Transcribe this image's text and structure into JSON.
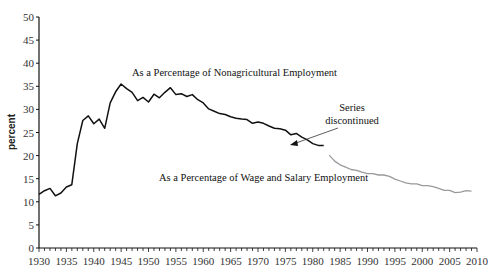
{
  "chart_data": {
    "type": "line",
    "title": "",
    "xlabel": "",
    "ylabel": "percent",
    "xlim": [
      1930,
      2010
    ],
    "ylim": [
      0,
      50
    ],
    "grid": false,
    "x_ticks": [
      1930,
      1935,
      1940,
      1945,
      1950,
      1955,
      1960,
      1965,
      1970,
      1975,
      1980,
      1985,
      1990,
      1995,
      2000,
      2005,
      2010
    ],
    "y_ticks": [
      0,
      5,
      10,
      15,
      20,
      25,
      30,
      35,
      40,
      45,
      50
    ],
    "series": [
      {
        "name": "As a Percentage of Nonagricultural Employment",
        "color": "#111111",
        "x": [
          1930,
          1931,
          1932,
          1933,
          1934,
          1935,
          1936,
          1937,
          1938,
          1939,
          1940,
          1941,
          1942,
          1943,
          1944,
          1945,
          1946,
          1947,
          1948,
          1949,
          1950,
          1951,
          1952,
          1953,
          1954,
          1955,
          1956,
          1957,
          1958,
          1959,
          1960,
          1961,
          1962,
          1963,
          1964,
          1965,
          1966,
          1967,
          1968,
          1969,
          1970,
          1971,
          1972,
          1973,
          1974,
          1975,
          1976,
          1977,
          1978,
          1979,
          1980,
          1981,
          1982
        ],
        "values": [
          11.6,
          12.4,
          12.9,
          11.3,
          11.9,
          13.2,
          13.7,
          22.6,
          27.6,
          28.6,
          26.9,
          27.9,
          25.9,
          31.4,
          33.8,
          35.5,
          34.5,
          33.7,
          31.9,
          32.6,
          31.6,
          33.3,
          32.5,
          33.7,
          34.7,
          33.2,
          33.4,
          32.8,
          33.2,
          32.1,
          31.4,
          30.1,
          29.6,
          29.1,
          28.9,
          28.4,
          28.1,
          27.9,
          27.8,
          27.0,
          27.3,
          27.0,
          26.4,
          25.9,
          25.8,
          25.5,
          24.5,
          24.8,
          24.0,
          23.4,
          22.6,
          22.2,
          22.2
        ]
      },
      {
        "name": "As a Percentage of Wage and Salary Employment",
        "color": "#9a9a9a",
        "x": [
          1983,
          1984,
          1985,
          1986,
          1987,
          1988,
          1989,
          1990,
          1991,
          1992,
          1993,
          1994,
          1995,
          1996,
          1997,
          1998,
          1999,
          2000,
          2001,
          2002,
          2003,
          2004,
          2005,
          2006,
          2007,
          2008,
          2009
        ],
        "values": [
          20.1,
          18.8,
          18.0,
          17.5,
          17.0,
          16.8,
          16.4,
          16.1,
          16.1,
          15.8,
          15.8,
          15.5,
          14.9,
          14.5,
          14.1,
          13.9,
          13.9,
          13.5,
          13.5,
          13.3,
          12.9,
          12.5,
          12.5,
          12.0,
          12.1,
          12.4,
          12.3
        ]
      }
    ],
    "annotations": [
      {
        "text": "As a Percentage of Nonagricultural Employment",
        "x": 1948,
        "y": 38.5
      },
      {
        "text": "As a Percentage of Wage and Salary Employment",
        "x": 1951,
        "y": 15.5
      },
      {
        "text_lines": [
          "Series",
          "discontinued"
        ],
        "x": 1992,
        "y": 26.5,
        "arrow_to": [
          1982,
          22.2
        ]
      }
    ]
  },
  "labels": {
    "ylabel": "percent",
    "series_a": "As a Percentage of Nonagricultural Employment",
    "series_b": "As a Percentage of Wage and Salary Employment",
    "note_line1": "Series",
    "note_line2": "discontinued"
  }
}
